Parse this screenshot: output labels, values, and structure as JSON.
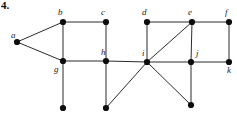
{
  "figure": {
    "problem_number": "4.",
    "width": 237,
    "height": 115,
    "background_color": "#ffffff",
    "edge_color": "#2b2b2b",
    "node_color": "#0d0d0d",
    "node_radius": 3.1
  },
  "vertices": [
    {
      "id": "a",
      "label": "a",
      "x": 17,
      "y": 42,
      "label_x": 11,
      "label_y": 31,
      "labeled": true
    },
    {
      "id": "b",
      "label": "b",
      "x": 63,
      "y": 22,
      "label_x": 58,
      "label_y": 8,
      "labeled": true
    },
    {
      "id": "c",
      "label": "c",
      "x": 106,
      "y": 22,
      "label_x": 101,
      "label_y": 8,
      "labeled": true
    },
    {
      "id": "d",
      "label": "d",
      "x": 147,
      "y": 22,
      "label_x": 142,
      "label_y": 8,
      "labeled": true
    },
    {
      "id": "e",
      "label": "e",
      "x": 192,
      "y": 22,
      "label_x": 188,
      "label_y": 8,
      "labeled": true
    },
    {
      "id": "f",
      "label": "f",
      "x": 229,
      "y": 22,
      "label_x": 225,
      "label_y": 8,
      "labeled": true
    },
    {
      "id": "g",
      "label": "g",
      "x": 63,
      "y": 61,
      "label_x": 54,
      "label_y": 65,
      "labeled": true
    },
    {
      "id": "h",
      "label": "h",
      "x": 106,
      "y": 61,
      "label_x": 101,
      "label_y": 48,
      "labeled": true
    },
    {
      "id": "i",
      "label": "i",
      "x": 147,
      "y": 62,
      "label_x": 142,
      "label_y": 49,
      "labeled": true
    },
    {
      "id": "j",
      "label": "j",
      "x": 191,
      "y": 62,
      "label_x": 196,
      "label_y": 49,
      "labeled": true
    },
    {
      "id": "k",
      "label": "k",
      "x": 229,
      "y": 62,
      "label_x": 227,
      "label_y": 66,
      "labeled": true
    },
    {
      "id": "p1",
      "label": "",
      "x": 63,
      "y": 108,
      "label_x": 0,
      "label_y": 0,
      "labeled": false
    },
    {
      "id": "p2",
      "label": "",
      "x": 106,
      "y": 108,
      "label_x": 0,
      "label_y": 0,
      "labeled": false
    },
    {
      "id": "p3",
      "label": "",
      "x": 191,
      "y": 105,
      "label_x": 0,
      "label_y": 0,
      "labeled": false
    }
  ],
  "edges": [
    {
      "from": "a",
      "to": "b"
    },
    {
      "from": "a",
      "to": "g"
    },
    {
      "from": "b",
      "to": "c"
    },
    {
      "from": "b",
      "to": "g"
    },
    {
      "from": "c",
      "to": "h"
    },
    {
      "from": "g",
      "to": "h"
    },
    {
      "from": "g",
      "to": "p1"
    },
    {
      "from": "h",
      "to": "i"
    },
    {
      "from": "h",
      "to": "p2"
    },
    {
      "from": "d",
      "to": "e"
    },
    {
      "from": "e",
      "to": "f"
    },
    {
      "from": "d",
      "to": "i"
    },
    {
      "from": "e",
      "to": "i"
    },
    {
      "from": "e",
      "to": "j"
    },
    {
      "from": "f",
      "to": "k"
    },
    {
      "from": "i",
      "to": "j"
    },
    {
      "from": "i",
      "to": "p2"
    },
    {
      "from": "i",
      "to": "p3"
    },
    {
      "from": "j",
      "to": "k"
    },
    {
      "from": "j",
      "to": "p3"
    }
  ]
}
